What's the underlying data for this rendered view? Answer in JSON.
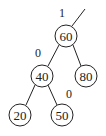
{
  "diagram": {
    "type": "binary-tree",
    "nodes": [
      {
        "id": "n60",
        "value": "60",
        "x": 66,
        "y": 36
      },
      {
        "id": "n40",
        "value": "40",
        "x": 42,
        "y": 76
      },
      {
        "id": "n80",
        "value": "80",
        "x": 86,
        "y": 76
      },
      {
        "id": "n20",
        "value": "20",
        "x": 20,
        "y": 115
      },
      {
        "id": "n50",
        "value": "50",
        "x": 62,
        "y": 115
      }
    ],
    "edges": [
      {
        "from": "n60",
        "to": "n40"
      },
      {
        "from": "n60",
        "to": "n80"
      },
      {
        "from": "n40",
        "to": "n20"
      },
      {
        "from": "n40",
        "to": "n50"
      }
    ],
    "labels": [
      {
        "text": "1",
        "x": 62,
        "y": 13,
        "attached_to": "n60"
      },
      {
        "text": "0",
        "x": 38,
        "y": 53,
        "attached_to": "n40"
      },
      {
        "text": "0",
        "x": 69,
        "y": 94,
        "attached_to": "n50"
      }
    ],
    "parent_edge_stub": {
      "x1": 72,
      "y1": 26,
      "x2": 85,
      "y2": 9
    },
    "node_radius": 11
  }
}
